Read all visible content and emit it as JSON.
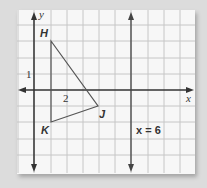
{
  "diagram": {
    "type": "coordinate-plane",
    "axes": {
      "x_label": "x",
      "y_label": "y"
    },
    "tick_labels": {
      "x": "2",
      "y": "1"
    },
    "grid": {
      "x_range": [
        -1,
        10
      ],
      "y_range": [
        -5,
        5
      ],
      "unit": 1
    },
    "triangle": {
      "vertices": [
        {
          "name": "H",
          "x": 1,
          "y": 3
        },
        {
          "name": "J",
          "x": 4,
          "y": -1
        },
        {
          "name": "K",
          "x": 1,
          "y": -2
        }
      ]
    },
    "line": {
      "label": "x = 6",
      "x": 6
    },
    "colors": {
      "grid": "#c8c8c8",
      "axis": "#333333",
      "background": "#f7f7f7"
    }
  }
}
